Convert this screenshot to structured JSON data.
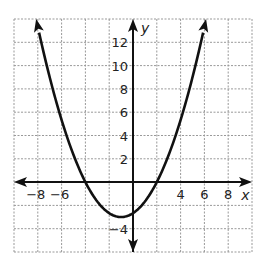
{
  "chart_data": {
    "type": "line",
    "title": "",
    "xlabel": "x",
    "ylabel": "y",
    "xlim": [
      -10,
      10
    ],
    "ylim": [
      -6,
      14
    ],
    "grid": true,
    "grid_step": 2,
    "x_tick_labels": [
      "-8",
      "-6",
      "4",
      "6",
      "8"
    ],
    "y_tick_labels": [
      "12",
      "10",
      "8",
      "6",
      "4",
      "2",
      "-4"
    ],
    "series": [
      {
        "name": "parabola",
        "equation": "y = (1/3)(x + 4)(x - 2)",
        "vertex": [
          -1,
          -3
        ],
        "x_intercepts": [
          -4,
          2
        ],
        "y_intercept": -2.67,
        "x": [
          -8.14,
          -8,
          -7,
          -6,
          -5,
          -4,
          -3,
          -2,
          -1,
          0,
          1,
          2,
          3,
          4,
          5,
          6,
          6.14
        ],
        "y": [
          14,
          13.33,
          9.67,
          5.33,
          2.33,
          0,
          -1.67,
          -2.67,
          -3,
          -2.67,
          -1.67,
          0,
          2.33,
          5.33,
          9.67,
          13.33,
          14
        ]
      }
    ]
  },
  "labels": {
    "x_axis": "x",
    "y_axis": "y",
    "xticks": [
      {
        "v": -8,
        "t": "−8"
      },
      {
        "v": -6,
        "t": "−6"
      },
      {
        "v": 4,
        "t": "4"
      },
      {
        "v": 6,
        "t": "6"
      },
      {
        "v": 8,
        "t": "8"
      }
    ],
    "yticks": [
      {
        "v": 12,
        "t": "12"
      },
      {
        "v": 10,
        "t": "10"
      },
      {
        "v": 8,
        "t": "8"
      },
      {
        "v": 6,
        "t": "6"
      },
      {
        "v": 4,
        "t": "4"
      },
      {
        "v": 2,
        "t": "2"
      },
      {
        "v": -4,
        "t": "−4"
      }
    ]
  }
}
